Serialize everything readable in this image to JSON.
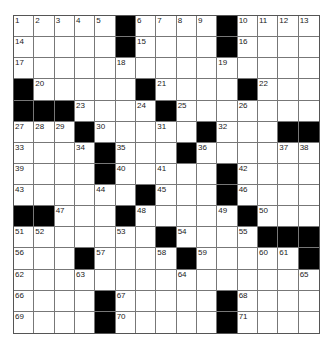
{
  "puzzle": {
    "rows": 15,
    "cols": 15,
    "colors": {
      "black": "#000000",
      "white": "#ffffff",
      "grid_line": "#777777"
    },
    "black_squares": [
      [
        0,
        5
      ],
      [
        0,
        10
      ],
      [
        1,
        5
      ],
      [
        1,
        10
      ],
      [
        3,
        0
      ],
      [
        3,
        6
      ],
      [
        3,
        11
      ],
      [
        4,
        0
      ],
      [
        4,
        1
      ],
      [
        4,
        2
      ],
      [
        4,
        7
      ],
      [
        5,
        3
      ],
      [
        5,
        9
      ],
      [
        5,
        13
      ],
      [
        5,
        14
      ],
      [
        6,
        4
      ],
      [
        6,
        8
      ],
      [
        7,
        4
      ],
      [
        7,
        10
      ],
      [
        8,
        6
      ],
      [
        8,
        10
      ],
      [
        9,
        0
      ],
      [
        9,
        1
      ],
      [
        9,
        5
      ],
      [
        9,
        11
      ],
      [
        10,
        7
      ],
      [
        10,
        12
      ],
      [
        10,
        13
      ],
      [
        10,
        14
      ],
      [
        11,
        3
      ],
      [
        11,
        8
      ],
      [
        11,
        14
      ],
      [
        13,
        4
      ],
      [
        13,
        10
      ],
      [
        14,
        4
      ],
      [
        14,
        10
      ]
    ],
    "numbers": [
      {
        "r": 0,
        "c": 0,
        "n": "1"
      },
      {
        "r": 0,
        "c": 1,
        "n": "2"
      },
      {
        "r": 0,
        "c": 2,
        "n": "3"
      },
      {
        "r": 0,
        "c": 3,
        "n": "4"
      },
      {
        "r": 0,
        "c": 4,
        "n": "5"
      },
      {
        "r": 0,
        "c": 6,
        "n": "6"
      },
      {
        "r": 0,
        "c": 7,
        "n": "7"
      },
      {
        "r": 0,
        "c": 8,
        "n": "8"
      },
      {
        "r": 0,
        "c": 9,
        "n": "9"
      },
      {
        "r": 0,
        "c": 11,
        "n": "10"
      },
      {
        "r": 0,
        "c": 12,
        "n": "11"
      },
      {
        "r": 0,
        "c": 13,
        "n": "12"
      },
      {
        "r": 0,
        "c": 14,
        "n": "13"
      },
      {
        "r": 1,
        "c": 0,
        "n": "14"
      },
      {
        "r": 1,
        "c": 6,
        "n": "15"
      },
      {
        "r": 1,
        "c": 11,
        "n": "16"
      },
      {
        "r": 2,
        "c": 0,
        "n": "17"
      },
      {
        "r": 2,
        "c": 5,
        "n": "18"
      },
      {
        "r": 2,
        "c": 10,
        "n": "19"
      },
      {
        "r": 3,
        "c": 1,
        "n": "20"
      },
      {
        "r": 3,
        "c": 7,
        "n": "21"
      },
      {
        "r": 3,
        "c": 12,
        "n": "22"
      },
      {
        "r": 4,
        "c": 3,
        "n": "23"
      },
      {
        "r": 4,
        "c": 6,
        "n": "24"
      },
      {
        "r": 4,
        "c": 8,
        "n": "25"
      },
      {
        "r": 4,
        "c": 11,
        "n": "26"
      },
      {
        "r": 5,
        "c": 0,
        "n": "27"
      },
      {
        "r": 5,
        "c": 1,
        "n": "28"
      },
      {
        "r": 5,
        "c": 2,
        "n": "29"
      },
      {
        "r": 5,
        "c": 4,
        "n": "30"
      },
      {
        "r": 5,
        "c": 7,
        "n": "31"
      },
      {
        "r": 5,
        "c": 10,
        "n": "32"
      },
      {
        "r": 6,
        "c": 0,
        "n": "33"
      },
      {
        "r": 6,
        "c": 3,
        "n": "34"
      },
      {
        "r": 6,
        "c": 5,
        "n": "35"
      },
      {
        "r": 6,
        "c": 9,
        "n": "36"
      },
      {
        "r": 6,
        "c": 13,
        "n": "37"
      },
      {
        "r": 6,
        "c": 14,
        "n": "38"
      },
      {
        "r": 7,
        "c": 0,
        "n": "39"
      },
      {
        "r": 7,
        "c": 5,
        "n": "40"
      },
      {
        "r": 7,
        "c": 7,
        "n": "41"
      },
      {
        "r": 7,
        "c": 11,
        "n": "42"
      },
      {
        "r": 8,
        "c": 0,
        "n": "43"
      },
      {
        "r": 8,
        "c": 4,
        "n": "44"
      },
      {
        "r": 8,
        "c": 7,
        "n": "45"
      },
      {
        "r": 8,
        "c": 11,
        "n": "46"
      },
      {
        "r": 9,
        "c": 2,
        "n": "47"
      },
      {
        "r": 9,
        "c": 6,
        "n": "48"
      },
      {
        "r": 9,
        "c": 10,
        "n": "49"
      },
      {
        "r": 9,
        "c": 12,
        "n": "50"
      },
      {
        "r": 10,
        "c": 0,
        "n": "51"
      },
      {
        "r": 10,
        "c": 1,
        "n": "52"
      },
      {
        "r": 10,
        "c": 5,
        "n": "53"
      },
      {
        "r": 10,
        "c": 8,
        "n": "54"
      },
      {
        "r": 10,
        "c": 11,
        "n": "55"
      },
      {
        "r": 11,
        "c": 0,
        "n": "56"
      },
      {
        "r": 11,
        "c": 4,
        "n": "57"
      },
      {
        "r": 11,
        "c": 7,
        "n": "58"
      },
      {
        "r": 11,
        "c": 9,
        "n": "59"
      },
      {
        "r": 11,
        "c": 12,
        "n": "60"
      },
      {
        "r": 11,
        "c": 13,
        "n": "61"
      },
      {
        "r": 12,
        "c": 0,
        "n": "62"
      },
      {
        "r": 12,
        "c": 3,
        "n": "63"
      },
      {
        "r": 12,
        "c": 8,
        "n": "64"
      },
      {
        "r": 12,
        "c": 14,
        "n": "65"
      },
      {
        "r": 13,
        "c": 0,
        "n": "66"
      },
      {
        "r": 13,
        "c": 5,
        "n": "67"
      },
      {
        "r": 13,
        "c": 11,
        "n": "68"
      },
      {
        "r": 14,
        "c": 0,
        "n": "69"
      },
      {
        "r": 14,
        "c": 5,
        "n": "70"
      },
      {
        "r": 14,
        "c": 11,
        "n": "71"
      }
    ]
  }
}
